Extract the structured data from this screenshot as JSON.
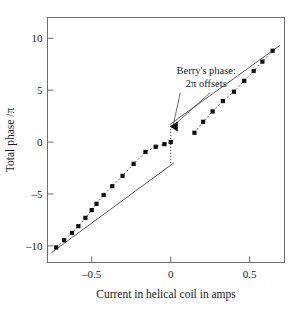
{
  "chart_data": {
    "type": "scatter",
    "title": "",
    "xlabel": "Current in helical coil in amps",
    "ylabel": "Total phase /π",
    "xlim": [
      -0.78,
      0.72
    ],
    "ylim": [
      -11.6,
      12.0
    ],
    "xticks": [
      -0.5,
      0,
      0.5
    ],
    "xticklabels": [
      "–0.5",
      "0",
      "0.5"
    ],
    "yticks": [
      10,
      5,
      0,
      -5,
      -10
    ],
    "yticklabels": [
      "10",
      "5",
      "0",
      "–5",
      "–10"
    ],
    "grid": false,
    "legend": null,
    "series": [
      {
        "name": "Measured total phase (branch 1, left)",
        "style": "markers-with-dotted-connector",
        "marker": "filled-square",
        "points": [
          {
            "x": -0.725,
            "y": -10.15
          },
          {
            "x": -0.675,
            "y": -9.45
          },
          {
            "x": -0.625,
            "y": -8.75
          },
          {
            "x": -0.585,
            "y": -8.1
          },
          {
            "x": -0.54,
            "y": -7.3
          },
          {
            "x": -0.5,
            "y": -6.55
          },
          {
            "x": -0.47,
            "y": -5.95
          },
          {
            "x": -0.425,
            "y": -5.1
          },
          {
            "x": -0.37,
            "y": -4.25
          },
          {
            "x": -0.305,
            "y": -3.25
          },
          {
            "x": -0.235,
            "y": -2.1
          },
          {
            "x": -0.16,
            "y": -0.95
          },
          {
            "x": -0.095,
            "y": -0.45
          },
          {
            "x": -0.04,
            "y": -0.2
          },
          {
            "x": 0.0,
            "y": 0.0
          }
        ]
      },
      {
        "name": "Measured total phase (branch 2, right)",
        "style": "markers-with-dotted-connector",
        "marker": "filled-square",
        "points": [
          {
            "x": 0.15,
            "y": 0.9
          },
          {
            "x": 0.205,
            "y": 1.95
          },
          {
            "x": 0.265,
            "y": 2.95
          },
          {
            "x": 0.33,
            "y": 3.95
          },
          {
            "x": 0.4,
            "y": 4.85
          },
          {
            "x": 0.465,
            "y": 5.9
          },
          {
            "x": 0.525,
            "y": 6.85
          },
          {
            "x": 0.58,
            "y": 7.75
          },
          {
            "x": 0.645,
            "y": 8.8
          }
        ]
      },
      {
        "name": "Theoretical line (lower branch)",
        "style": "solid-line",
        "points": [
          {
            "x": -0.755,
            "y": -10.65
          },
          {
            "x": 0.02,
            "y": -2.0
          }
        ]
      },
      {
        "name": "Theoretical line (upper branch)",
        "style": "solid-line",
        "points": [
          {
            "x": -0.005,
            "y": 1.7
          },
          {
            "x": 0.69,
            "y": 9.3
          }
        ]
      },
      {
        "name": "2-pi jump at zero current",
        "style": "dotted-vertical",
        "points": [
          {
            "x": 0.0,
            "y": -2.0
          },
          {
            "x": 0.0,
            "y": 1.7
          }
        ]
      }
    ],
    "annotations": [
      {
        "name": "berrys-phase-annotation",
        "lines": [
          "Berry's phase:",
          "2π offsets"
        ],
        "text_x": 0.225,
        "text_y": 6.6,
        "arrow_target": {
          "x": 0.0,
          "y": 1.5
        },
        "leader_lines": 2,
        "arrowhead": "filled-triangle-left"
      }
    ]
  },
  "axes": {
    "frame_color": "#6b6b6b",
    "marker_color": "#0d0d0d",
    "line_color": "#5a5a5a"
  }
}
